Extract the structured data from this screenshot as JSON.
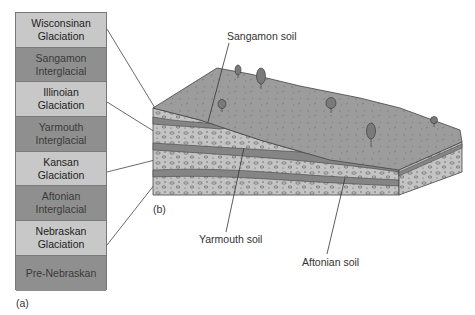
{
  "column": {
    "rows": [
      {
        "label": "Wisconsinan Glaciation",
        "line1": "Wisconsinan",
        "line2": "Glaciation",
        "shade": "light"
      },
      {
        "label": "Sangamon Interglacial",
        "line1": "Sangamon",
        "line2": "Interglacial",
        "shade": "dark"
      },
      {
        "label": "Illinoian Glaciation",
        "line1": "Illinoian",
        "line2": "Glaciation",
        "shade": "light"
      },
      {
        "label": "Yarmouth Interglacial",
        "line1": "Yarmouth",
        "line2": "Interglacial",
        "shade": "dark"
      },
      {
        "label": "Kansan Glaciation",
        "line1": "Kansan",
        "line2": "Glaciation",
        "shade": "light"
      },
      {
        "label": "Aftonian Interglacial",
        "line1": "Aftonian",
        "line2": "Interglacial",
        "shade": "dark"
      },
      {
        "label": "Nebraskan Glaciation",
        "line1": "Nebraskan",
        "line2": "Glaciation",
        "shade": "light"
      },
      {
        "label": "Pre-Nebraskan",
        "line1": "Pre-Nebraskan",
        "line2": "",
        "shade": "dark"
      }
    ],
    "panel_label": "(a)"
  },
  "block": {
    "panel_label": "(b)",
    "soil_labels": {
      "sangamon": "Sangamon soil",
      "yarmouth": "Yarmouth soil",
      "aftonian": "Aftonian soil"
    }
  },
  "colors": {
    "light_cell": "#c8c8c8",
    "dark_cell": "#8f8f8f",
    "surface": "#9a9a9a",
    "till": "#c4c4c4",
    "soil": "#858585",
    "outline": "#444444"
  }
}
